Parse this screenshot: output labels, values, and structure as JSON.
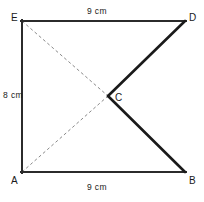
{
  "figure": {
    "stroke_color": "#1a1a1a",
    "outline_color": "#2b2b2b",
    "dash_color": "#8a8a8a",
    "background": "#ffffff",
    "vertices": [
      {
        "id": "E",
        "label": "E",
        "x": 22,
        "y": 21
      },
      {
        "id": "D",
        "label": "D",
        "x": 185,
        "y": 21
      },
      {
        "id": "C",
        "label": "C",
        "x": 108,
        "y": 96
      },
      {
        "id": "B",
        "label": "B",
        "x": 185,
        "y": 172
      },
      {
        "id": "A",
        "label": "A",
        "x": 22,
        "y": 172
      }
    ],
    "solid_edges": [
      {
        "name": "edge-ED",
        "from": "E",
        "to": "D"
      },
      {
        "name": "edge-EA",
        "from": "E",
        "to": "A"
      },
      {
        "name": "edge-AB",
        "from": "A",
        "to": "B"
      },
      {
        "name": "edge-DC",
        "from": "D",
        "to": "C"
      },
      {
        "name": "edge-CB",
        "from": "C",
        "to": "B"
      }
    ],
    "dashed_edges": [
      {
        "name": "diagonal-EC",
        "from": "E",
        "to": "C"
      },
      {
        "name": "diagonal-AC",
        "from": "A",
        "to": "C"
      }
    ],
    "dimensions": [
      {
        "id": "top",
        "text": "9 cm",
        "edge": "ED",
        "position": "above"
      },
      {
        "id": "bottom",
        "text": "9 cm",
        "edge": "AB",
        "position": "below"
      },
      {
        "id": "left",
        "text": "8 cm",
        "edge": "EA",
        "position": "left"
      }
    ]
  }
}
